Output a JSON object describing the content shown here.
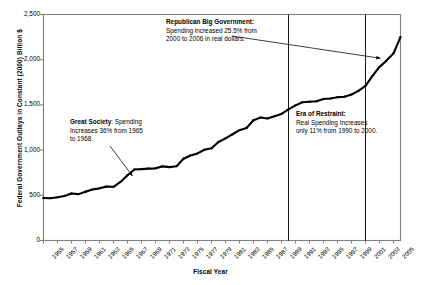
{
  "chart_data": {
    "type": "line",
    "title": "",
    "xlabel": "Fiscal Year",
    "ylabel": "Federal Government Outlays in Constant (2000) Billion $",
    "xlim": [
      1955,
      2006
    ],
    "ylim": [
      0,
      2500
    ],
    "y_ticks": [
      "0",
      "500",
      "1,000",
      "1,500",
      "2,000",
      "2,500"
    ],
    "y_tick_values": [
      0,
      500,
      1000,
      1500,
      2000,
      2500
    ],
    "x_ticks": [
      "1955",
      "1957",
      "1959",
      "1961",
      "1963",
      "1965",
      "1967",
      "1969",
      "1971",
      "1973",
      "1975",
      "1977",
      "1979",
      "1981",
      "1983",
      "1985",
      "1987",
      "1989",
      "1991",
      "1993",
      "1995",
      "1997",
      "1999",
      "2001",
      "2003",
      "2005"
    ],
    "grid": false,
    "legend": "none",
    "series": [
      {
        "name": "Federal Government Outlays (Constant 2000 $)",
        "color": "#000000",
        "x": [
          1955,
          1956,
          1957,
          1958,
          1959,
          1960,
          1961,
          1962,
          1963,
          1964,
          1965,
          1966,
          1967,
          1968,
          1969,
          1970,
          1971,
          1972,
          1973,
          1974,
          1975,
          1976,
          1977,
          1978,
          1979,
          1980,
          1981,
          1982,
          1983,
          1984,
          1985,
          1986,
          1987,
          1988,
          1989,
          1990,
          1991,
          1992,
          1993,
          1994,
          1995,
          1996,
          1997,
          1998,
          1999,
          2000,
          2001,
          2002,
          2003,
          2004,
          2005,
          2006
        ],
        "values": [
          470,
          468,
          478,
          492,
          520,
          513,
          540,
          565,
          577,
          596,
          594,
          648,
          722,
          786,
          790,
          795,
          798,
          820,
          812,
          822,
          905,
          940,
          963,
          1004,
          1020,
          1090,
          1130,
          1175,
          1220,
          1245,
          1330,
          1360,
          1350,
          1375,
          1400,
          1450,
          1495,
          1530,
          1535,
          1540,
          1565,
          1570,
          1585,
          1590,
          1615,
          1655,
          1710,
          1820,
          1920,
          1990,
          2070,
          2250
        ]
      }
    ],
    "vertical_markers": [
      {
        "label": "1990",
        "x": 1990
      },
      {
        "label": "2001",
        "x": 2001
      }
    ],
    "annotations": [
      {
        "id": "republican-big-government",
        "head": "Republican Big Government:",
        "lines": [
          "Spending increased 25.5% from",
          "2000 to 2006 in real dollars."
        ],
        "arrow_to_year": 2004,
        "arrow_to_value": 2060
      },
      {
        "id": "great-society",
        "head": "Great Society",
        "head_suffix": ": Spending",
        "lines": [
          "Increases 36% from 1965",
          "to 1968."
        ],
        "arrow_to_year": 1968,
        "arrow_to_value": 790
      },
      {
        "id": "era-of-restraint",
        "head": "Era of Restraint:",
        "lines": [
          "Real Spending Increases",
          "only 11% from 1990 to 2000."
        ],
        "arrow_to_year": null,
        "arrow_to_value": null
      }
    ]
  },
  "axis": {
    "y_title": "Federal Government Outlays in Constant (2000) Billion $",
    "x_title": "Fiscal Year"
  },
  "colors": {
    "line": "#000000",
    "frame": "#808080",
    "background": "#ffffff",
    "annotation_text": "#000000"
  }
}
